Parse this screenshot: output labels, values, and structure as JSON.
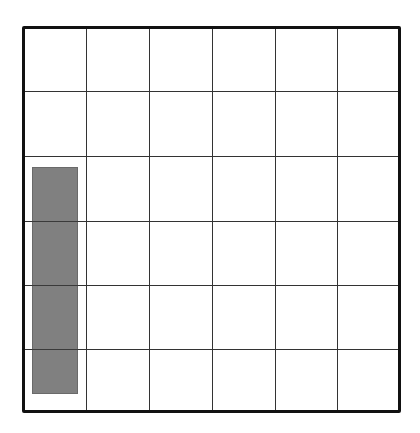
{
  "diagram": {
    "type": "grid",
    "rows": 6,
    "columns": 6,
    "colors": {
      "background": "#ffffff",
      "border": "#111111",
      "grid_line": "#333333",
      "shaded_fill": "#808080"
    },
    "shaded_block": {
      "column_start": 0,
      "column_span": 1,
      "row_start": 2.15,
      "row_end": 5.65,
      "description": "gray vertical rectangle in first column"
    }
  }
}
